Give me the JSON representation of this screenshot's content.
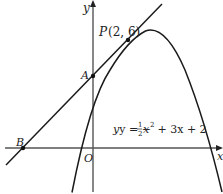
{
  "diagram": {
    "type": "coordinate-geometry",
    "axes": {
      "x_label": "x",
      "y_label": "y",
      "origin_label": "O"
    },
    "curve": {
      "equation_label_prefix": "y = −",
      "equation_fraction_num": "1",
      "equation_fraction_den": "2",
      "equation_label_suffix_var": "x",
      "equation_label_exp": "2",
      "equation_label_rest": " + 3x + 2",
      "equation": "y = -1/2 x^2 + 3x + 2"
    },
    "tangent_line": {
      "equation": "y = x + 4"
    },
    "points": [
      {
        "name": "P",
        "label": "P",
        "coords_label": "(2, 6)",
        "x": 2,
        "y": 6
      },
      {
        "name": "A",
        "label": "A",
        "x": 0,
        "y": 4
      },
      {
        "name": "B",
        "label": "B",
        "x": -4,
        "y": 0
      }
    ],
    "colors": {
      "line": "#1a1a1a",
      "axis": "#555555",
      "background": "#ffffff"
    }
  }
}
